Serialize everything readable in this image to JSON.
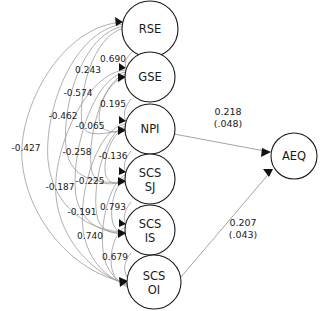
{
  "diagram": {
    "type": "sem-path-diagram",
    "title": "",
    "background_color": "#ffffff",
    "node_stroke_color": "#1a1a1a",
    "edge_color": "#9a9a9a",
    "label_color": "#1a1a1a"
  },
  "nodes": [
    {
      "id": "RSE",
      "label": "RSE",
      "label_line1": "RSE",
      "label_line2": "",
      "cx": 150,
      "cy": 29,
      "r": 28
    },
    {
      "id": "GSE",
      "label": "GSE",
      "label_line1": "GSE",
      "label_line2": "",
      "cx": 150,
      "cy": 77,
      "r": 25
    },
    {
      "id": "NPI",
      "label": "NPI",
      "label_line1": "NPI",
      "label_line2": "",
      "cx": 150,
      "cy": 129,
      "r": 25
    },
    {
      "id": "SCS_SJ",
      "label": "SCS SJ",
      "label_line1": "SCS",
      "label_line2": "SJ",
      "cx": 150,
      "cy": 179,
      "r": 25
    },
    {
      "id": "SCS_IS",
      "label": "SCS IS",
      "label_line1": "SCS",
      "label_line2": "IS",
      "cx": 150,
      "cy": 230,
      "r": 25
    },
    {
      "id": "SCS_OI",
      "label": "SCS OI",
      "label_line1": "SCS",
      "label_line2": "OI",
      "cx": 154,
      "cy": 282,
      "r": 27
    },
    {
      "id": "AEQ",
      "label": "AEQ",
      "label_line1": "AEQ",
      "label_line2": "",
      "cx": 294,
      "cy": 156,
      "r": 23
    }
  ],
  "adjacent_labels": [
    {
      "id": "lbl_0690",
      "value": "0.690",
      "x": 113,
      "y": 59
    },
    {
      "id": "lbl_0243",
      "value": "0.243",
      "x": 88,
      "y": 70
    },
    {
      "id": "lbl_0195",
      "value": "0.195",
      "x": 113,
      "y": 104
    },
    {
      "id": "lbl_n0065",
      "value": "-0.065",
      "x": 90,
      "y": 126
    },
    {
      "id": "lbl_n0136",
      "value": "-0.136",
      "x": 113,
      "y": 156
    },
    {
      "id": "lbl_n0225",
      "value": "-0.225",
      "x": 90,
      "y": 181
    },
    {
      "id": "lbl_0793",
      "value": "0.793",
      "x": 113,
      "y": 207
    },
    {
      "id": "lbl_0740",
      "value": "0.740",
      "x": 90,
      "y": 236
    },
    {
      "id": "lbl_0679",
      "value": "0.679",
      "x": 115,
      "y": 257
    }
  ],
  "correlation_labels": [
    {
      "id": "cor_n0427",
      "value": "-0.427",
      "x": 26,
      "y": 148
    },
    {
      "id": "cor_n0462",
      "value": "-0.462",
      "x": 63,
      "y": 116
    },
    {
      "id": "cor_n0574",
      "value": "-0.574",
      "x": 78,
      "y": 93
    },
    {
      "id": "cor_n0258",
      "value": "-0.258",
      "x": 77,
      "y": 152
    },
    {
      "id": "cor_n0187",
      "value": "-0.187",
      "x": 60,
      "y": 187
    },
    {
      "id": "cor_n0191",
      "value": "-0.191",
      "x": 82,
      "y": 212
    }
  ],
  "structural_paths": [
    {
      "id": "path_npi_aeq",
      "from": "NPI",
      "to": "AEQ",
      "estimate": "0.218",
      "standard_error": "(.048)",
      "label_x": 228,
      "label_y": 116
    },
    {
      "id": "path_scsoi_aeq",
      "from": "SCS_OI",
      "to": "AEQ",
      "estimate": "0.207",
      "standard_error": "(.043)",
      "label_x": 243,
      "label_y": 227
    }
  ]
}
